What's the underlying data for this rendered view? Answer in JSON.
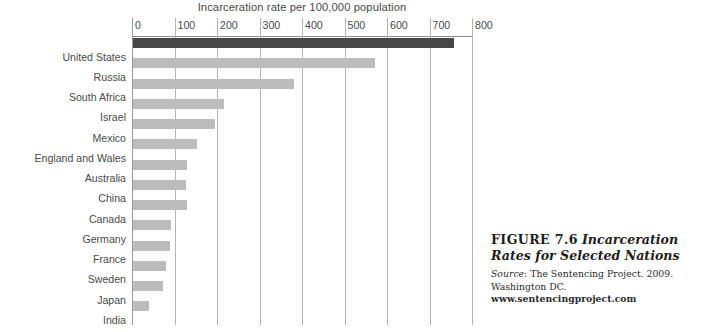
{
  "chart_data": {
    "type": "bar",
    "orientation": "horizontal",
    "title": "Incarceration rate per 100,000 population",
    "xlabel": "",
    "ylabel": "",
    "xlim": [
      0,
      800
    ],
    "xticks": [
      0,
      100,
      200,
      300,
      400,
      500,
      600,
      700,
      800
    ],
    "grid": true,
    "legend": null,
    "categories": [
      "United States",
      "Russia",
      "South Africa",
      "Israel",
      "Mexico",
      "England and Wales",
      "Australia",
      "China",
      "Canada",
      "Germany",
      "France",
      "Sweden",
      "Japan",
      "India"
    ],
    "values": [
      756,
      569,
      379,
      214,
      192,
      151,
      127,
      125,
      127,
      90,
      86,
      78,
      71,
      37
    ],
    "highlight_index": 0,
    "colors": {
      "bar": "#bcbcbc",
      "bar_highlight": "#474747",
      "gridline": "#b4b4b4",
      "axis": "#8d8d8d",
      "text": "#4a4a4a"
    }
  },
  "caption": {
    "figure_number": "FIGURE 7.6",
    "title": "Incarceration Rates for Selected Nations",
    "source_word": "Source",
    "source_text": ": The Sentencing Project. 2009. Washington DC. ",
    "source_url": "www.sentencingproject.com"
  }
}
